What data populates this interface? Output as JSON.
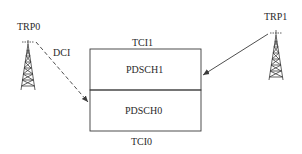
{
  "diagram": {
    "nodes": {
      "trp0": {
        "label": "TRP0"
      },
      "trp1": {
        "label": "TRP1"
      },
      "pdsch1": {
        "label": "PDSCH1"
      },
      "pdsch0": {
        "label": "PDSCH0"
      }
    },
    "annotations": {
      "tci1": "TCI1",
      "tci0": "TCI0",
      "dci": "DCI"
    },
    "edges": [
      {
        "from": "TRP0",
        "to": "PDSCH0",
        "label": "DCI",
        "style": "dashed"
      },
      {
        "from": "TRP1",
        "to": "PDSCH1",
        "label": "",
        "style": "solid"
      }
    ],
    "colors": {
      "line": "#3a3a3a",
      "background": "#ffffff"
    }
  }
}
